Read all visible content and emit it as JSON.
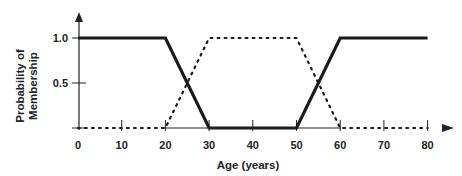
{
  "chart_data": {
    "type": "line",
    "title": "",
    "xlabel": "Age (years)",
    "ylabel": [
      "Probability of",
      "Membership"
    ],
    "xlim": [
      0,
      80
    ],
    "ylim": [
      0,
      1.0
    ],
    "x_ticks": [
      0,
      10,
      20,
      30,
      40,
      50,
      60,
      70,
      80
    ],
    "x_tick_labels": [
      "0",
      "10",
      "20",
      "30",
      "40",
      "50",
      "60",
      "70",
      "80"
    ],
    "y_ticks": [
      0.5,
      1.0
    ],
    "y_tick_labels": [
      "0.5",
      "1.0"
    ],
    "grid": false,
    "legend": null,
    "series": [
      {
        "name": "solid (young / old membership)",
        "style": "solid-thick",
        "color": "#1a1a1a",
        "x": [
          0,
          20,
          30,
          50,
          60,
          80
        ],
        "y": [
          1.0,
          1.0,
          0.0,
          0.0,
          1.0,
          1.0
        ]
      },
      {
        "name": "dotted (middle-aged membership)",
        "style": "dotted",
        "color": "#1a1a1a",
        "x": [
          0,
          20,
          30,
          50,
          60,
          80
        ],
        "y": [
          0.0,
          0.0,
          1.0,
          1.0,
          0.0,
          0.0
        ]
      }
    ]
  },
  "axes": {
    "x_label": "Age (years)",
    "y_label_line1": "Probability of",
    "y_label_line2": "Membership",
    "y_tick_labels": [
      "1.0",
      "0.5"
    ],
    "x_tick_labels": [
      "0",
      "10",
      "20",
      "30",
      "40",
      "50",
      "60",
      "70",
      "80"
    ]
  }
}
